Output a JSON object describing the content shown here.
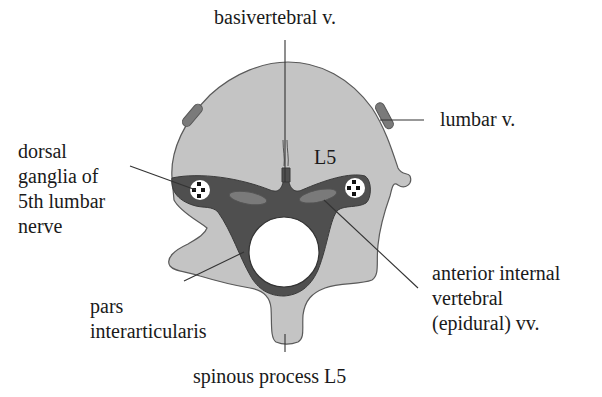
{
  "figure": {
    "vertebra_label": "L5",
    "colors": {
      "background": "#ffffff",
      "bone": "#c4c4c4",
      "bone_outline": "#5a5a5a",
      "canal_dark": "#4f4f4f",
      "vein": "#7a7a7a",
      "cord": "#ffffff",
      "text": "#1a1a1a"
    }
  },
  "labels": {
    "basivertebral": "basivertebral v.",
    "lumbar": "lumbar v.",
    "dorsal_ganglia": [
      "dorsal",
      "ganglia of",
      "5th lumbar",
      "nerve"
    ],
    "anterior_internal": [
      "anterior internal",
      "vertebral",
      "(epidural) vv."
    ],
    "pars": [
      "pars",
      "interarticularis"
    ],
    "spinous": "spinous process L5"
  }
}
